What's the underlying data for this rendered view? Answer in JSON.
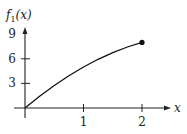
{
  "chart_data": {
    "type": "line",
    "title": "",
    "xlabel": "x",
    "ylabel": "f1(x)",
    "ylabel_main": "f",
    "ylabel_sub": "1",
    "ylabel_args": "(x)",
    "xlim": [
      0,
      2.5
    ],
    "ylim": [
      0,
      10
    ],
    "x_ticks": [
      1,
      2
    ],
    "x_tick_labels": [
      "1",
      "2"
    ],
    "y_ticks": [
      3,
      6,
      9
    ],
    "y_tick_labels": [
      "3",
      "6",
      "9"
    ],
    "grid": false,
    "series": [
      {
        "name": "f1(x)",
        "x": [
          0,
          0.25,
          0.5,
          0.75,
          1.0,
          1.25,
          1.5,
          1.75,
          2.0
        ],
        "y": [
          0,
          1.44,
          2.75,
          3.94,
          5.0,
          5.94,
          6.75,
          7.44,
          8.0
        ],
        "endpoint_marker": {
          "x": 2,
          "y": 8,
          "style": "filled-dot"
        }
      }
    ]
  }
}
